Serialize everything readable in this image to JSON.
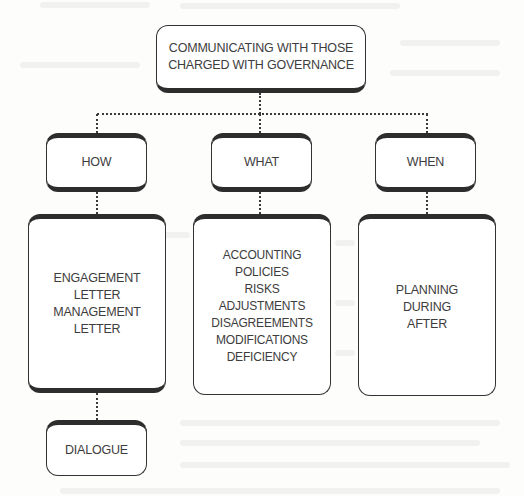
{
  "diagram": {
    "root": {
      "lines": [
        "COMMUNICATING WITH THOSE",
        "CHARGED WITH GOVERNANCE"
      ]
    },
    "branches": [
      {
        "heading": "HOW",
        "details": [
          "ENGAGEMENT",
          "LETTER",
          "MANAGEMENT",
          "LETTER"
        ],
        "extra": "DIALOGUE"
      },
      {
        "heading": "WHAT",
        "details": [
          "ACCOUNTING",
          "POLICIES",
          "RISKS",
          "ADJUSTMENTS",
          "DISAGREEMENTS",
          "MODIFICATIONS",
          "DEFICIENCY"
        ]
      },
      {
        "heading": "WHEN",
        "details": [
          "PLANNING",
          "DURING",
          "AFTER"
        ]
      }
    ],
    "colors": {
      "border": "#333333",
      "text": "#3d3d3d",
      "background": "#fdfdfc"
    }
  }
}
